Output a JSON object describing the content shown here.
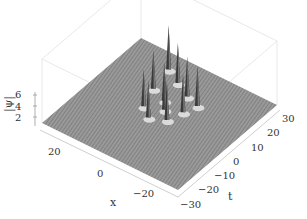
{
  "chart_data": {
    "type": "surface3d",
    "title": "",
    "xlabel": "x",
    "ylabel": "t",
    "zlabel": "|ψ|",
    "x_ticks": [
      "20",
      "0",
      "−20"
    ],
    "t_ticks": [
      "30",
      "20",
      "10",
      "0",
      "−10",
      "−20",
      "−30"
    ],
    "z_ticks": [
      "6",
      "4",
      "2"
    ],
    "xlim": [
      -30,
      30
    ],
    "tlim": [
      -30,
      30
    ],
    "zlim": [
      1,
      7
    ],
    "background_level": 1,
    "surface_color": "#8a8a8a",
    "peaks": [
      {
        "x": 12,
        "t": 22,
        "height": 6.5
      },
      {
        "x": 5,
        "t": 18,
        "height": 6.0
      },
      {
        "x": -2,
        "t": 14,
        "height": 6.0
      },
      {
        "x": 10,
        "t": 10,
        "height": 5.8
      },
      {
        "x": 3,
        "t": 7,
        "height": 5.8
      },
      {
        "x": -8,
        "t": 12,
        "height": 6.0
      },
      {
        "x": 7,
        "t": 0,
        "height": 5.6
      },
      {
        "x": 0,
        "t": 3,
        "height": 5.8
      },
      {
        "x": -6,
        "t": 6,
        "height": 5.8
      },
      {
        "x": 2,
        "t": -4,
        "height": 5.6
      },
      {
        "x": -4,
        "t": -1,
        "height": 5.8
      }
    ]
  }
}
